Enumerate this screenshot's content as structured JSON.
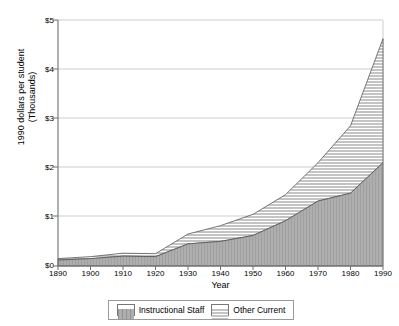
{
  "chart_data": {
    "type": "area",
    "title": "",
    "subtitle": "",
    "xlabel": "Year",
    "ylabel": "1990 dollars per student\n(Thousands)",
    "stacked": true,
    "grid": true,
    "legend_position": "bottom",
    "xlim": [
      1890,
      1990
    ],
    "ylim": [
      0,
      5
    ],
    "x": [
      1890,
      1900,
      1910,
      1920,
      1930,
      1940,
      1950,
      1960,
      1970,
      1980,
      1990
    ],
    "categories": [
      "1890",
      "1900",
      "1910",
      "1920",
      "1930",
      "1940",
      "1950",
      "1960",
      "1970",
      "1980",
      "1990"
    ],
    "xticks": [
      "1890",
      "1900",
      "1910",
      "1920",
      "1930",
      "1940",
      "1950",
      "1960",
      "1970",
      "1980",
      "1990"
    ],
    "yticks": [
      "$0",
      "$1",
      "$2",
      "$3",
      "$4",
      "$5"
    ],
    "ytick_values": [
      0,
      1,
      2,
      3,
      4,
      5
    ],
    "series": [
      {
        "name": "Instructional Staff",
        "fill": "#a8a8a8",
        "pattern": "vertical-hatch",
        "values": [
          0.12,
          0.15,
          0.2,
          0.19,
          0.45,
          0.5,
          0.62,
          0.92,
          1.32,
          1.48,
          2.1
        ]
      },
      {
        "name": "Other Current",
        "fill": "#ffffff",
        "pattern": "horizontal-hatch",
        "values": [
          0.03,
          0.04,
          0.06,
          0.06,
          0.2,
          0.32,
          0.43,
          0.53,
          0.78,
          1.37,
          2.52
        ]
      }
    ],
    "cumulative_totals": [
      0.15,
      0.19,
      0.26,
      0.25,
      0.65,
      0.82,
      1.05,
      1.45,
      2.1,
      2.85,
      4.62
    ]
  },
  "legend": {
    "entries": [
      {
        "label": "Instructional Staff",
        "swatch": "vertical-hatch-swatch"
      },
      {
        "label": "Other Current",
        "swatch": "horizontal-hatch-swatch"
      }
    ]
  },
  "colors": {
    "area_fill": "#a8a8a8",
    "grid": "#c8c8c8",
    "axis": "#6f6f6f",
    "text": "#000000",
    "background": "#ffffff"
  }
}
